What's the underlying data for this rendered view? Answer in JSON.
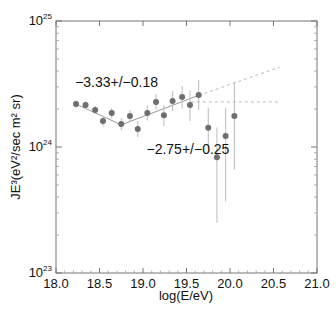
{
  "chart_data": {
    "type": "scatter",
    "title": "",
    "xlabel": "log(E/eV)",
    "ylabel": "JE³(eV²/sec m² sr)",
    "xlim": [
      18.0,
      21.0
    ],
    "ylim_log10": [
      23,
      25
    ],
    "yscale": "log",
    "grid": false,
    "x_ticks": [
      "18.0",
      "18.5",
      "19.0",
      "19.5",
      "20.0",
      "20.5",
      "21.0"
    ],
    "y_ticks": [
      {
        "base": "10",
        "exp": "25",
        "log": 25
      },
      {
        "base": "10",
        "exp": "24",
        "log": 24
      },
      {
        "base": "10",
        "exp": "23",
        "log": 23
      }
    ],
    "series": [
      {
        "name": "measured flux",
        "points": [
          {
            "x": 18.23,
            "y": 2.19e+24,
            "lo": 2.05e+24,
            "hi": 2.33e+24
          },
          {
            "x": 18.34,
            "y": 2.15e+24,
            "lo": 2e+24,
            "hi": 2.3e+24
          },
          {
            "x": 18.45,
            "y": 1.97e+24,
            "lo": 1.82e+24,
            "hi": 2.12e+24
          },
          {
            "x": 18.54,
            "y": 1.61e+24,
            "lo": 1.46e+24,
            "hi": 1.77e+24
          },
          {
            "x": 18.64,
            "y": 1.86e+24,
            "lo": 1.69e+24,
            "hi": 2.04e+24
          },
          {
            "x": 18.75,
            "y": 1.52e+24,
            "lo": 1.36e+24,
            "hi": 1.7e+24
          },
          {
            "x": 18.85,
            "y": 1.76e+24,
            "lo": 1.57e+24,
            "hi": 1.97e+24
          },
          {
            "x": 18.94,
            "y": 1.39e+24,
            "lo": 1.2e+24,
            "hi": 1.6e+24
          },
          {
            "x": 19.05,
            "y": 1.86e+24,
            "lo": 1.62e+24,
            "hi": 2.13e+24
          },
          {
            "x": 19.15,
            "y": 2.28e+24,
            "lo": 1.97e+24,
            "hi": 2.62e+24
          },
          {
            "x": 19.24,
            "y": 1.79e+24,
            "lo": 1.47e+24,
            "hi": 2.15e+24
          },
          {
            "x": 19.34,
            "y": 2.32e+24,
            "lo": 1.93e+24,
            "hi": 2.78e+24
          },
          {
            "x": 19.45,
            "y": 2.49e+24,
            "lo": 2.02e+24,
            "hi": 3.05e+24
          },
          {
            "x": 19.54,
            "y": 2.15e+24,
            "lo": 1.61e+24,
            "hi": 2.8e+24
          },
          {
            "x": 19.64,
            "y": 2.59e+24,
            "lo": 1.97e+24,
            "hi": 3.4e+24
          },
          {
            "x": 19.75,
            "y": 1.42e+24,
            "lo": 9.2e+23,
            "hi": 2.05e+24
          },
          {
            "x": 19.85,
            "y": 8.3e+23,
            "lo": 2.5e+23,
            "hi": 1.43e+24
          },
          {
            "x": 19.95,
            "y": 1.22e+24,
            "lo": 3.7e+23,
            "hi": 2.05e+24
          },
          {
            "x": 20.05,
            "y": 1.76e+24,
            "lo": 6.6e+23,
            "hi": 3.3e+24
          }
        ]
      }
    ],
    "fit_lines": [
      {
        "name": "fit-below-ankle",
        "style": "solid",
        "from": {
          "x": 18.23,
          "y": 2.19e+24
        },
        "to": {
          "x": 18.75,
          "y": 1.5e+24
        }
      },
      {
        "name": "fit-above-ankle",
        "style": "solid",
        "from": {
          "x": 18.75,
          "y": 1.5e+24
        },
        "to": {
          "x": 19.64,
          "y": 2.57e+24
        }
      },
      {
        "name": "extrapolation",
        "style": "dashed",
        "from": {
          "x": 19.64,
          "y": 2.57e+24
        },
        "to": {
          "x": 20.57,
          "y": 4.3e+24
        }
      },
      {
        "name": "flat-reference",
        "style": "dashed",
        "from": {
          "x": 19.55,
          "y": 2.28e+24
        },
        "to": {
          "x": 20.57,
          "y": 2.28e+24
        }
      }
    ],
    "annotations": [
      {
        "text": "−3.33+/−0.18",
        "x": 18.22,
        "y": 3e+24
      },
      {
        "text": "−2.75+/−0.25",
        "x": 19.04,
        "y": 8.8e+23
      }
    ]
  }
}
